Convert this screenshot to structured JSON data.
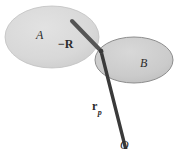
{
  "figure": {
    "kind": "vector-diagram",
    "background_color": "#ffffff",
    "line_color": "#3a3a3a",
    "labels": {
      "body_a": "A",
      "body_b": "B",
      "vector_minus_r": "−R",
      "vector_minus_r_sign": "−",
      "vector_minus_r_symbol": "R",
      "vector_rp_symbol": "r",
      "vector_rp_subscript": "p",
      "origin": "O"
    },
    "shapes": {
      "ellipse_a": {
        "name": "A",
        "cx": 52,
        "cy": 37,
        "rx": 47,
        "ry": 31,
        "fill": "#d6d6d6",
        "stroke": "#bdbdbd"
      },
      "ellipse_b": {
        "name": "B",
        "cx": 134,
        "cy": 60,
        "rx": 39,
        "ry": 23,
        "fill": "#cfcfcf",
        "stroke": "#8f8f8f"
      }
    },
    "vectors": {
      "minus_r": {
        "label": "−R",
        "x1": 72,
        "y1": 21,
        "x2": 101,
        "y2": 51,
        "width": 4
      },
      "r_p": {
        "label": "r_p",
        "x1": 101,
        "y1": 51,
        "x2": 126,
        "y2": 149,
        "width": 3.4
      }
    }
  }
}
